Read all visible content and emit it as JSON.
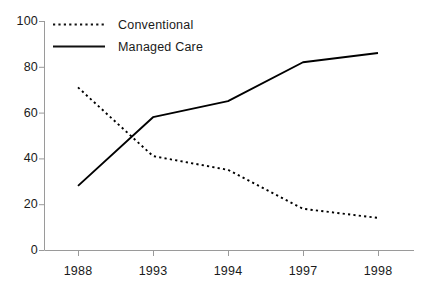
{
  "chart_data": {
    "type": "line",
    "title": "",
    "subtitle": "",
    "xlabel": "",
    "ylabel": "",
    "categories": [
      "1988",
      "1993",
      "1994",
      "1997",
      "1998"
    ],
    "series": [
      {
        "name": "Conventional",
        "style": "dotted",
        "color": "#000000",
        "values": [
          71,
          41,
          35,
          18,
          14
        ]
      },
      {
        "name": "Managed Care",
        "style": "solid",
        "color": "#000000",
        "values": [
          28,
          58,
          65,
          82,
          86
        ]
      }
    ],
    "ylim": [
      0,
      100
    ],
    "y_ticks": [
      "0",
      "20",
      "40",
      "60",
      "80",
      "100"
    ],
    "x_ticks": [
      "1988",
      "1993",
      "1994",
      "1997",
      "1998"
    ],
    "grid": false,
    "legend_position": "top-left-inside",
    "axis_color": "#9a9a9a"
  },
  "legend": {
    "entries": [
      {
        "label": "Conventional",
        "swatch": "dotted-line-swatch"
      },
      {
        "label": "Managed Care",
        "swatch": "solid-line-swatch"
      }
    ]
  }
}
